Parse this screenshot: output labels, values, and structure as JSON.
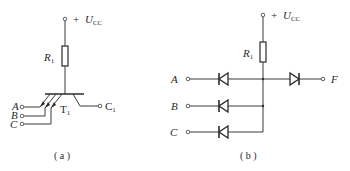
{
  "figure_a": {
    "supply_label": "U",
    "supply_sub": "CC",
    "supply_sign": "+",
    "resistor_label": "R",
    "resistor_sub": "1",
    "transistor_label": "T",
    "transistor_sub": "1",
    "output_label": "C",
    "output_sub": "1",
    "inputs": [
      "A",
      "B",
      "C"
    ],
    "caption": "( a )"
  },
  "figure_b": {
    "supply_label": "U",
    "supply_sub": "CC",
    "supply_sign": "+",
    "resistor_label": "R",
    "resistor_sub": "1",
    "inputs": [
      "A",
      "B",
      "C"
    ],
    "output_label": "F",
    "caption": "( b )"
  },
  "colors": {
    "line": "#3a3a3a",
    "text": "#2a2a2a",
    "background": "#ffffff"
  }
}
